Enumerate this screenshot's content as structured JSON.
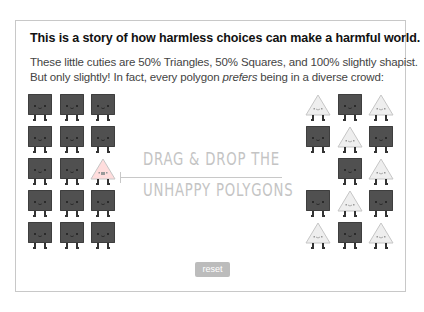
{
  "intro": {
    "title": "This is a story of how harmless choices can make a harmful world.",
    "line1": "These little cuties are 50% Triangles, 50% Squares, and 100% slightly shapist.",
    "line2_before": "But only slightly! In fact, every polygon ",
    "line2_em": "prefers",
    "line2_after": " being in a diverse crowd:"
  },
  "instruction": {
    "line1": "DRAG & DROP THE",
    "line2": "UNHAPPY POLYGONS"
  },
  "reset_label": "reset",
  "colors": {
    "square": "#505050",
    "triangle": "#eeeeee",
    "triangle_unhappy": "#ffdddd",
    "instruction_text": "#c4c4c4",
    "reset_bg": "#bcbcbc"
  },
  "left_grid": {
    "rows": [
      [
        "square",
        "square",
        "square"
      ],
      [
        "square",
        "square",
        "square"
      ],
      [
        "square",
        "square",
        "triangle-unhappy"
      ],
      [
        "square",
        "square",
        "square"
      ],
      [
        "square",
        "square",
        "square"
      ]
    ]
  },
  "right_grid": {
    "rows": [
      [
        "triangle",
        "square",
        "triangle"
      ],
      [
        "square",
        "triangle",
        "square"
      ],
      [
        "empty",
        "square",
        "triangle"
      ],
      [
        "square",
        "triangle",
        "square"
      ],
      [
        "triangle",
        "square",
        "triangle"
      ]
    ]
  }
}
